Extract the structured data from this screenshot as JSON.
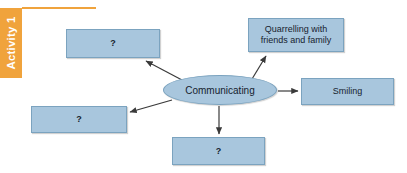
{
  "activity": {
    "label": "Activity 1"
  },
  "diagram": {
    "center": {
      "label": "Communicating"
    },
    "nodes": [
      {
        "id": "top-left",
        "label": "?"
      },
      {
        "id": "quarrelling",
        "label": "Quarrelling with friends and family"
      },
      {
        "id": "smiling",
        "label": "Smiling"
      },
      {
        "id": "bottom-left",
        "label": "?"
      },
      {
        "id": "bottom-center",
        "label": "?"
      }
    ]
  },
  "colors": {
    "accent_orange": "#f0a33c",
    "node_fill": "#a8c6dd",
    "node_border": "#7ba3bf",
    "arrow": "#3a3a3a",
    "text": "#16222e",
    "background": "#ffffff"
  }
}
